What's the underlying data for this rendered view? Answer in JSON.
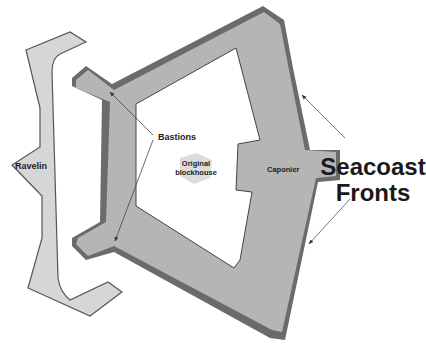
{
  "colors": {
    "background": "#ffffff",
    "fort_fill": "#b5b5b5",
    "fort_shadow": "#6b6b6b",
    "ravelin_fill": "#d6d6d6",
    "ravelin_edge": "#555555",
    "blockhouse_fill": "#dcdcdc",
    "arrow": "#555555",
    "text": "#222222"
  },
  "labels": {
    "ravelin": "Ravelin",
    "bastions": "Bastions",
    "blockhouse_line1": "Original",
    "blockhouse_line2": "blockhouse",
    "caponier": "Caponier",
    "seacoast_line1": "Seacoast",
    "seacoast_line2": "Fronts"
  }
}
